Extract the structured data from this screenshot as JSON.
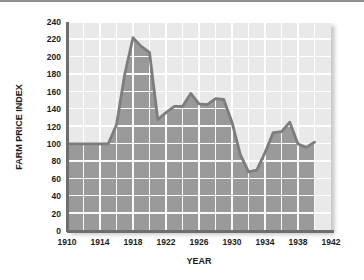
{
  "chart_data": {
    "type": "area",
    "title": "",
    "xlabel": "YEAR",
    "ylabel": "FARM PRICE INDEX",
    "xlim": [
      1910,
      1942
    ],
    "ylim": [
      0,
      240
    ],
    "grid": true,
    "legend": "none",
    "xticks": [
      1910,
      1914,
      1918,
      1922,
      1926,
      1930,
      1934,
      1938,
      1942
    ],
    "xtick_labels": [
      "1910",
      "1914",
      "1918",
      "1922",
      "1926",
      "1930",
      "1934",
      "1938",
      "1942"
    ],
    "yticks": [
      0,
      20,
      40,
      60,
      80,
      100,
      120,
      140,
      160,
      180,
      200,
      220,
      240
    ],
    "ytick_labels": [
      "0",
      "20",
      "40",
      "60",
      "80",
      "100",
      "120",
      "140",
      "160",
      "180",
      "200",
      "220",
      "240"
    ],
    "x": [
      1910,
      1911,
      1912,
      1913,
      1914,
      1915,
      1916,
      1917,
      1918,
      1919,
      1920,
      1921,
      1922,
      1923,
      1924,
      1925,
      1926,
      1927,
      1928,
      1929,
      1930,
      1931,
      1932,
      1933,
      1934,
      1935,
      1936,
      1937,
      1938,
      1939,
      1940
    ],
    "values": [
      100,
      100,
      100,
      100,
      100,
      100,
      122,
      180,
      222,
      212,
      205,
      128,
      136,
      143,
      143,
      158,
      146,
      145,
      152,
      151,
      125,
      88,
      68,
      70,
      90,
      113,
      114,
      125,
      100,
      96,
      102
    ],
    "series": [
      {
        "name": "Farm Price Index",
        "values": [
          100,
          100,
          100,
          100,
          100,
          100,
          122,
          180,
          222,
          212,
          205,
          128,
          136,
          143,
          143,
          158,
          146,
          145,
          152,
          151,
          125,
          88,
          68,
          70,
          90,
          113,
          114,
          125,
          100,
          96,
          102
        ]
      }
    ],
    "colors": {
      "fill": "#9a9a9a",
      "line": "#7d7d7d",
      "plot_background": "#e9e9e9",
      "gridlines": "#ffffff",
      "axis": "#6e6e6e",
      "text": "#1c1c1c"
    }
  }
}
